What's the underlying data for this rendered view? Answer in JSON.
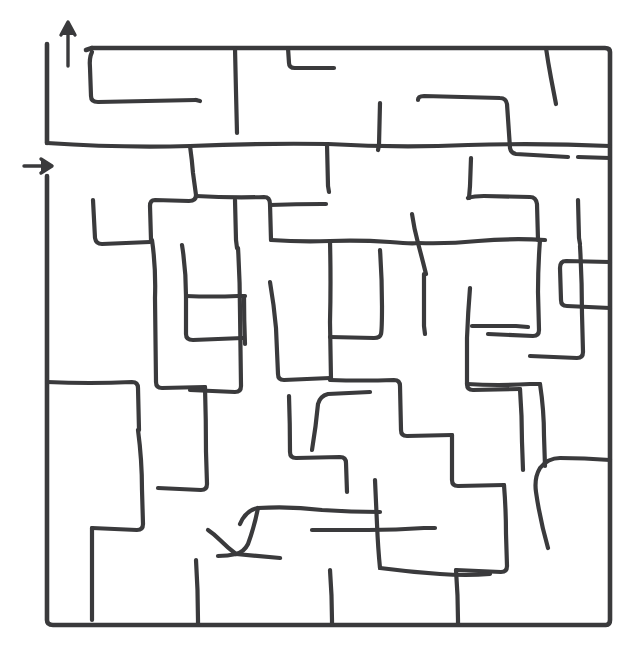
{
  "page": {
    "width": 642,
    "height": 666,
    "background_color": "#ffffff",
    "ink_color": "#3a3a3c",
    "style": "hand-drawn / sketch, single-stroke black lines on white"
  },
  "maze": {
    "type": "perfect-maze",
    "shape": "square",
    "grid_columns": 10,
    "grid_rows": 10,
    "cell_size_px": 57,
    "border": {
      "left_x": 47,
      "top_y": 48,
      "right_x": 610,
      "bottom_y": 625
    },
    "entrance": {
      "label": "entrance",
      "side": "left",
      "arrow_direction": "right",
      "arrow_glyph": "→",
      "x": 38,
      "y": 166
    },
    "exit": {
      "label": "exit",
      "side": "top",
      "arrow_direction": "up",
      "arrow_glyph": "↑",
      "x": 68,
      "y": 30
    }
  },
  "paths": {
    "border": [
      "M 47 44 L 47 143",
      "M 47 176 L 47 620 Q 47 625 53 625 L 606 625 Q 610 625 610 620 L 610 52 Q 610 48 605 48 L 92 48",
      "M 92 48 L 86 50"
    ],
    "walls": [
      "M 92 52 Q 89 58 90 68 L 91 96 Q 91 102 98 102 L 196 100",
      "M 235 48 L 236 92 L 237 133",
      "M 288 48 L 289 63 Q 289 68 295 68 L 330 68",
      "M 546 48 Q 548 62 551 78 L 556 104",
      "M 47 143 Q 120 148 190 146 Q 260 143 328 144 Q 398 148 468 145 Q 540 143 610 146",
      "M 190 146 Q 192 160 193 173 L 196 195 Q 196 201 189 201 L 155 200 Q 150 200 150 206 L 151 240",
      "M 327 144 L 328 186 L 329 192",
      "M 418 100 Q 418 96 424 96 L 500 98 Q 506 98 507 104 L 510 148 Q 511 153 516 154 L 568 157",
      "M 380 103 L 379 145 L 378 150",
      "M 471 158 L 470 186 L 469 198",
      "M 93 200 Q 94 220 95 238 Q 96 244 102 244 L 150 242",
      "M 196 196 Q 230 198 264 197 Q 270 197 270 204 L 271 240",
      "M 271 240 Q 300 242 330 241 Q 360 240 390 242 Q 412 244 418 243",
      "M 418 243 Q 414 228 412 214",
      "M 418 243 Q 422 258 426 274",
      "M 418 243 Q 448 244 478 241 Q 512 238 545 240",
      "M 468 198 Q 474 196 484 196 L 530 197 Q 536 197 537 204 L 538 240",
      "M 578 200 L 579 238 L 580 244",
      "M 152 240 Q 156 268 155 298 L 156 382 Q 156 388 162 388 L 205 387",
      "M 235 200 L 236 240 L 237 248",
      "M 270 205 Q 296 204 322 204 L 326 204",
      "M 182 245 Q 186 270 186 296 L 186 334 Q 186 340 193 340 L 243 338",
      "M 270 282 Q 274 305 276 328 L 278 374 Q 278 380 284 380 L 330 378",
      "M 186 296 Q 212 297 238 296 L 245 296",
      "M 330 241 Q 331 282 330 322 L 331 380",
      "M 540 240 Q 538 266 538 292 L 539 330 Q 539 336 533 336 L 488 334",
      "M 424 274 Q 424 300 424 326 L 425 334",
      "M 470 288 Q 468 312 467 338 L 467 384 Q 467 390 473 390 L 520 389",
      "M 380 250 Q 382 278 382 306 Q 382 330 381 334 Q 380 338 374 338 L 330 337",
      "M 610 262 L 566 261 Q 560 261 560 268 L 561 300 Q 561 306 567 306 L 610 308",
      "M 47 382 Q 90 384 132 382 Q 138 382 138 388 L 139 430",
      "M 330 380 Q 362 381 394 380 Q 400 380 400 386 L 401 430 Q 401 436 407 436 L 452 435",
      "M 467 384 Q 498 386 530 384 L 540 384",
      "M 580 246 Q 582 280 582 314 L 583 352 Q 583 358 577 358 L 530 356",
      "M 238 248 Q 240 280 240 312 L 241 386 Q 241 392 235 392 L 190 390",
      "M 205 387 Q 206 420 206 452 L 207 484 Q 207 490 201 490 L 158 488",
      "M 138 430 Q 142 460 142 490 L 143 524 Q 143 530 137 530 L 92 528",
      "M 289 396 Q 290 424 290 452 Q 290 458 296 458 L 340 457 Q 346 457 346 463 L 347 492",
      "M 452 435 Q 452 460 452 480 Q 452 486 458 486 L 504 485",
      "M 540 384 Q 544 410 544 436 L 545 466",
      "M 610 460 Q 584 458 560 458 Q 548 458 540 468 Q 534 478 536 492 Q 540 520 548 548",
      "M 504 485 Q 506 510 506 534 L 507 566 Q 507 572 501 572 L 456 570",
      "M 375 480 Q 376 502 377 524 Q 378 548 380 568",
      "M 312 530 Q 340 530 368 530 Q 396 530 424 528 L 435 528",
      "M 240 524 Q 246 510 258 508 Q 290 506 322 510 Q 350 512 380 512",
      "M 258 508 Q 254 528 248 544 Q 244 552 236 554 Q 228 556 218 556",
      "M 236 554 Q 228 548 220 540 Q 214 534 208 530",
      "M 236 554 Q 258 556 280 558",
      "M 380 568 Q 410 572 440 574 Q 466 576 490 574",
      "M 196 560 Q 198 590 198 620 L 198 625",
      "M 92 528 Q 92 560 92 592 L 92 620",
      "M 330 570 Q 332 596 332 620 L 332 625",
      "M 456 570 Q 458 596 458 620 L 458 625",
      "M 520 389 Q 522 416 522 442 L 523 470",
      "M 312 450 Q 316 426 318 404 Q 320 396 328 394 L 370 392",
      "M 244 296 Q 244 320 245 344",
      "M 472 326 Q 494 326 516 326 L 528 327",
      "M 578 157 L 610 158",
      "M 196 100 L 200 101",
      "M 330 68 L 334 68"
    ],
    "entrance_arrow": [
      "M 24 166 L 50 166",
      "M 41 159 L 52 166 L 41 173"
    ],
    "exit_arrow": [
      "M 68 66 L 68 24",
      "M 61 35 L 68 22 L 75 35"
    ]
  }
}
